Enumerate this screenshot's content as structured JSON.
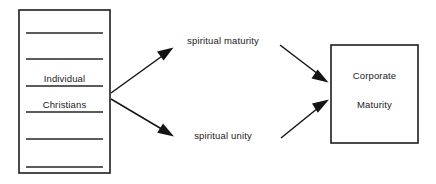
{
  "diagram": {
    "type": "flow-diagram",
    "colors": {
      "background": "#ffffff",
      "stroke": "#141414",
      "text": "#1a1a1a"
    },
    "source_box": {
      "name": "individual-christians-box",
      "line1": "Individual",
      "line2": "Christians",
      "rule_count": 6,
      "rules_y": [
        33,
        59,
        86,
        112,
        139,
        167
      ],
      "bounds": {
        "x": 19,
        "y": 10,
        "width": 91,
        "height": 163
      }
    },
    "intermediate_nodes": [
      {
        "name": "spiritual-maturity-label",
        "label": "spiritual maturity",
        "x": 223,
        "y": 44
      },
      {
        "name": "spiritual-unity-label",
        "label": "spiritual unity",
        "x": 223,
        "y": 139
      }
    ],
    "target_box": {
      "name": "corporate-maturity-box",
      "line1": "Corporate",
      "line2": "Maturity",
      "bounds": {
        "x": 331,
        "y": 45,
        "width": 87,
        "height": 98
      }
    },
    "edges": [
      {
        "name": "edge-source-to-spiritual-maturity",
        "from": "individual-christians-box",
        "to": "spiritual-maturity-label"
      },
      {
        "name": "edge-source-to-spiritual-unity",
        "from": "individual-christians-box",
        "to": "spiritual-unity-label"
      },
      {
        "name": "edge-spiritual-maturity-to-corporate",
        "from": "spiritual-maturity-label",
        "to": "corporate-maturity-box"
      },
      {
        "name": "edge-spiritual-unity-to-corporate",
        "from": "spiritual-unity-label",
        "to": "corporate-maturity-box"
      }
    ]
  }
}
